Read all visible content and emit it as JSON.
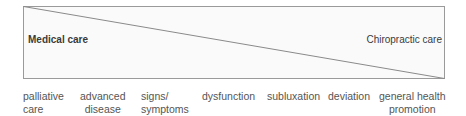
{
  "diagram": {
    "left_label": "Medical care",
    "right_label": "Chiropractic care",
    "colors": {
      "line": "#8a8a8a",
      "text": "#555555",
      "label": "#3a3a3a"
    },
    "stages": [
      {
        "line1": "palliative",
        "line2": "care"
      },
      {
        "line1": "advanced",
        "line2": "disease"
      },
      {
        "line1": "signs/",
        "line2": "symptoms"
      },
      {
        "line1": "dysfunction",
        "line2": ""
      },
      {
        "line1": "subluxation",
        "line2": ""
      },
      {
        "line1": "deviation",
        "line2": ""
      },
      {
        "line1": "general health",
        "line2": "promotion"
      }
    ]
  }
}
